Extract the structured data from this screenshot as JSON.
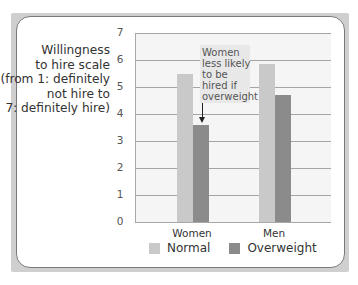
{
  "chart_data": {
    "type": "bar",
    "title": "",
    "ylabel": "Willingness to hire scale (from 1: definitely not hire to 7: definitely hire)",
    "ylabel_lines": [
      "Willingness",
      "to hire scale",
      "(from 1: definitely",
      "not hire to",
      "7: definitely hire)"
    ],
    "xlabel": "",
    "categories": [
      "Women",
      "Men"
    ],
    "series": [
      {
        "name": "Normal",
        "color": "#c9c9c9",
        "values": [
          5.5,
          5.85
        ]
      },
      {
        "name": "Overweight",
        "color": "#8b8b8b",
        "values": [
          3.6,
          4.7
        ]
      }
    ],
    "ylim": [
      0,
      7
    ],
    "yticks": [
      "0",
      "1",
      "2",
      "3",
      "4",
      "5",
      "6",
      "7"
    ],
    "grid": true,
    "legend_position": "bottom",
    "annotation": {
      "lines": [
        "Women",
        "less likely",
        "to be",
        "hired if",
        "overweight"
      ],
      "text": "Women less likely to be hired if overweight",
      "points_to": {
        "category": "Women",
        "series": "Overweight"
      }
    }
  }
}
